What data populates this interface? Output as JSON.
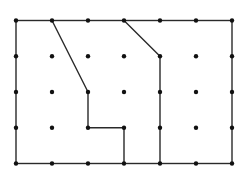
{
  "diagram": {
    "type": "dot-grid-partition",
    "grid": {
      "columns": 7,
      "rows": 5,
      "x_positions": [
        16,
        52,
        88,
        124,
        160,
        196,
        232
      ],
      "y_positions": [
        20.5,
        56.3,
        92,
        127.8,
        163.5
      ],
      "dot_radius": 2.2,
      "dot_color": "#111111"
    },
    "line_color": "#2a2a2a",
    "line_width": 1.4,
    "outer_rectangle": {
      "from": [
        0,
        0
      ],
      "to": [
        6,
        4
      ]
    },
    "paths": [
      {
        "name": "left-region-boundary",
        "points": [
          [
            1,
            0
          ],
          [
            2,
            2
          ],
          [
            2,
            3
          ],
          [
            3,
            3
          ],
          [
            3,
            4
          ]
        ]
      },
      {
        "name": "right-region-boundary",
        "points": [
          [
            3,
            0
          ],
          [
            4,
            1
          ],
          [
            4,
            4
          ]
        ]
      }
    ]
  }
}
